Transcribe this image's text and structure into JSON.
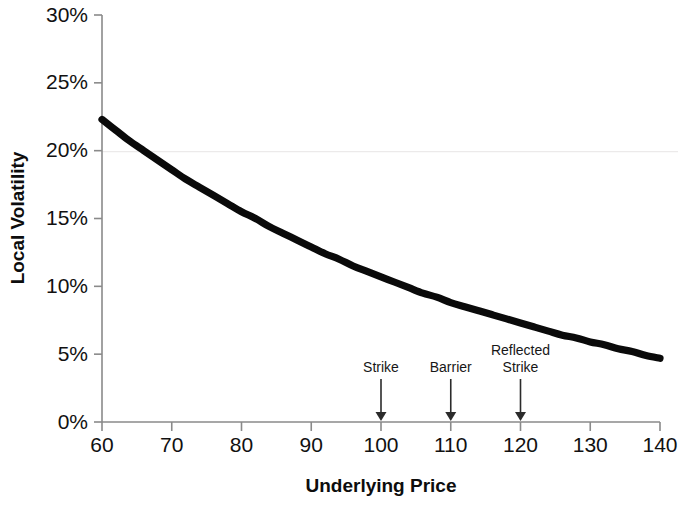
{
  "chart_data": {
    "type": "line",
    "title": "",
    "xlabel": "Underlying Price",
    "ylabel": "Local Volatility",
    "xlim": [
      60,
      140
    ],
    "ylim": [
      0,
      30
    ],
    "grid": false,
    "legend": "none",
    "x_tick_labels": [
      "60",
      "70",
      "80",
      "90",
      "100",
      "110",
      "120",
      "130",
      "140"
    ],
    "x_ticks": [
      60,
      70,
      80,
      90,
      100,
      110,
      120,
      130,
      140
    ],
    "y_tick_labels": [
      "0%",
      "5%",
      "10%",
      "15%",
      "20%",
      "25%",
      "30%"
    ],
    "y_ticks": [
      0,
      5,
      10,
      15,
      20,
      25,
      30
    ],
    "series": [
      {
        "name": "Local Volatility",
        "x": [
          60,
          62,
          64,
          66,
          68,
          70,
          72,
          74,
          76,
          78,
          80,
          82,
          84,
          86,
          88,
          90,
          92,
          94,
          96,
          98,
          100,
          102,
          104,
          106,
          108,
          110,
          112,
          114,
          116,
          118,
          120,
          122,
          124,
          126,
          128,
          130,
          132,
          134,
          136,
          138,
          140
        ],
        "values": [
          22.3,
          21.5,
          20.7,
          20.0,
          19.3,
          18.6,
          17.9,
          17.3,
          16.7,
          16.1,
          15.5,
          15.0,
          14.4,
          13.9,
          13.4,
          12.9,
          12.4,
          12.0,
          11.5,
          11.1,
          10.7,
          10.3,
          9.9,
          9.5,
          9.2,
          8.8,
          8.5,
          8.2,
          7.9,
          7.6,
          7.3,
          7.0,
          6.7,
          6.4,
          6.2,
          5.9,
          5.7,
          5.4,
          5.2,
          4.9,
          4.7
        ]
      }
    ],
    "annotations": [
      {
        "label": "Strike",
        "label_lines": [
          "Strike"
        ],
        "x": 100,
        "y": 0
      },
      {
        "label": "Barrier",
        "label_lines": [
          "Barrier"
        ],
        "x": 110,
        "y": 0
      },
      {
        "label": "Reflected Strike",
        "label_lines": [
          "Reflected",
          "Strike"
        ],
        "x": 120,
        "y": 0
      }
    ],
    "colors": {
      "curve": "#0a0a0a",
      "axis": "#8a8a8a",
      "text": "#111111",
      "annotation": "#2b2b2b",
      "background": "#ffffff"
    }
  }
}
